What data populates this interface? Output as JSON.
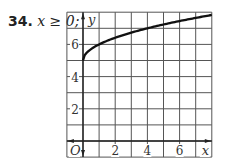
{
  "problem": {
    "number": "34.",
    "condition": "x ≥ 0;"
  },
  "chart_data": {
    "type": "line",
    "title": "",
    "xlabel": "x",
    "ylabel": "y",
    "xlim": [
      -1,
      8
    ],
    "ylim": [
      -1,
      8
    ],
    "grid": true,
    "x_ticks": [
      2,
      4,
      6
    ],
    "y_ticks": [
      2,
      4,
      6
    ],
    "origin_label": "O",
    "series": [
      {
        "name": "y = √x + 5",
        "x": [
          0,
          0.25,
          0.5,
          1,
          2,
          3,
          4,
          5,
          6,
          7,
          8
        ],
        "y": [
          5,
          5.5,
          5.71,
          6,
          6.41,
          6.73,
          7,
          7.24,
          7.45,
          7.65,
          7.83
        ]
      }
    ]
  }
}
